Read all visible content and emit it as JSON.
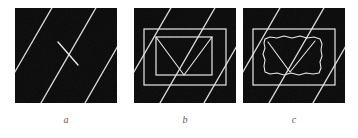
{
  "figure": {
    "title": "",
    "background_color": "#ffffff",
    "panel_background_color": "#080808",
    "stroke_color": "#e8e8e8",
    "caption_color": "#5a5a5a",
    "panel_width": 102,
    "panel_height": 95,
    "panels": [
      {
        "id": "a",
        "caption": "a",
        "description": "dark textured square with white diagonal stripes and a single short line segment",
        "stripe_angle_deg": 60,
        "stripe_offsets": [
          -62,
          -18,
          26,
          70,
          114
        ],
        "stripe_width": 1.3,
        "contents": {
          "segments": [
            {
              "name": "short-line",
              "x1": 43,
              "y1": 34,
              "x2": 63,
              "y2": 57
            }
          ],
          "rectangles": [],
          "polylines": []
        }
      },
      {
        "id": "b",
        "caption": "b",
        "description": "dark textured square with white diagonal stripes, a clean outer rectangle, an inner rectangle and a downward triangle",
        "stripe_angle_deg": 60,
        "stripe_offsets": [
          -62,
          -18,
          26,
          70,
          114
        ],
        "stripe_width": 1.3,
        "contents": {
          "rectangles": [
            {
              "name": "outer-rectangle",
              "x": 10,
              "y": 21,
              "w": 82,
              "h": 56
            },
            {
              "name": "inner-rectangle",
              "x": 22,
              "y": 29,
              "w": 56,
              "h": 38
            }
          ],
          "polylines": [
            {
              "name": "triangle-v",
              "points": "22,29 50,67 78,29"
            }
          ],
          "segments": []
        }
      },
      {
        "id": "c",
        "caption": "c",
        "description": "dark textured square with white diagonal stripes, a clean outer rectangle, a wobbly hand-drawn inner rectangle and a partial triangle",
        "stripe_angle_deg": 60,
        "stripe_offsets": [
          -62,
          -18,
          26,
          70,
          114
        ],
        "stripe_width": 1.3,
        "contents": {
          "rectangles": [
            {
              "name": "outer-rectangle",
              "x": 10,
              "y": 21,
              "w": 82,
              "h": 56
            }
          ],
          "polylines": [
            {
              "name": "wobbly-inner-rectangle",
              "points": "22,31 27,29 34,30 41,28 49,30 57,28 64,30 71,29 77,31 79,36 78,42 79,48 77,54 78,60 76,65 70,66 63,65 56,67 48,65 41,67 34,65 27,66 22,64 21,58 22,52 20,46 22,40 21,35 22,31"
            },
            {
              "name": "partial-triangle",
              "points": "25,34 47,64 72,33"
            }
          ],
          "segments": []
        }
      }
    ]
  }
}
